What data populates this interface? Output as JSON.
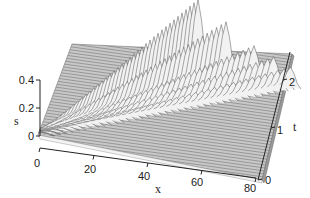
{
  "chart_data": {
    "type": "surface",
    "subtype": "3d-waterfall-mesh",
    "title": "",
    "xlabel": "x",
    "ylabel": "t",
    "zlabel": "s",
    "x_ticks": [
      "0",
      "20",
      "40",
      "60",
      "80"
    ],
    "t_ticks": [
      "0",
      "1",
      "2"
    ],
    "s_ticks": [
      "0",
      "0.2",
      "0.4"
    ],
    "xlim": [
      0,
      80
    ],
    "tlim": [
      0,
      2.5
    ],
    "slim": [
      0,
      0.5
    ],
    "grid": false,
    "legend": null,
    "ridges": [
      {
        "name": "ridge-1",
        "x_at_t_max": 45,
        "peak_s": 0.5
      },
      {
        "name": "ridge-2",
        "x_at_t_max": 55,
        "peak_s": 0.38
      },
      {
        "name": "ridge-3",
        "x_at_t_max": 65,
        "peak_s": 0.25
      },
      {
        "name": "ridge-4",
        "x_at_t_max": 72,
        "peak_s": 0.2
      },
      {
        "name": "ridge-5",
        "x_at_t_max": 78,
        "peak_s": 0.15
      }
    ],
    "colors": {
      "mesh": "#888888",
      "surface_fill": "#bdbdbd",
      "axis": "#222222",
      "background": "#ffffff"
    }
  }
}
